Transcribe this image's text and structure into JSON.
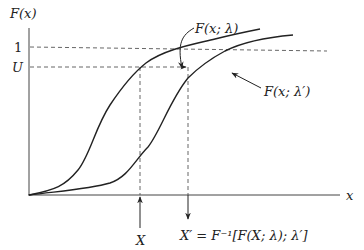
{
  "diagram": {
    "y_axis_label": "F(x)",
    "x_axis_label": "x",
    "y_ticks": [
      {
        "label": "1",
        "value": 1.0
      },
      {
        "label": "U",
        "value": 0.82
      }
    ],
    "x_markers": [
      {
        "label": "X"
      },
      {
        "label": "X′ = F⁻¹[F(X; λ); λ′]"
      }
    ],
    "curves": [
      {
        "name": "F(x; λ)",
        "label": "F(x; λ)"
      },
      {
        "name": "F(x; λ′)",
        "label": "F(x; λ′)"
      }
    ],
    "colors": {
      "line": "#222222",
      "dashed": "#555555",
      "background": "#ffffff"
    }
  }
}
